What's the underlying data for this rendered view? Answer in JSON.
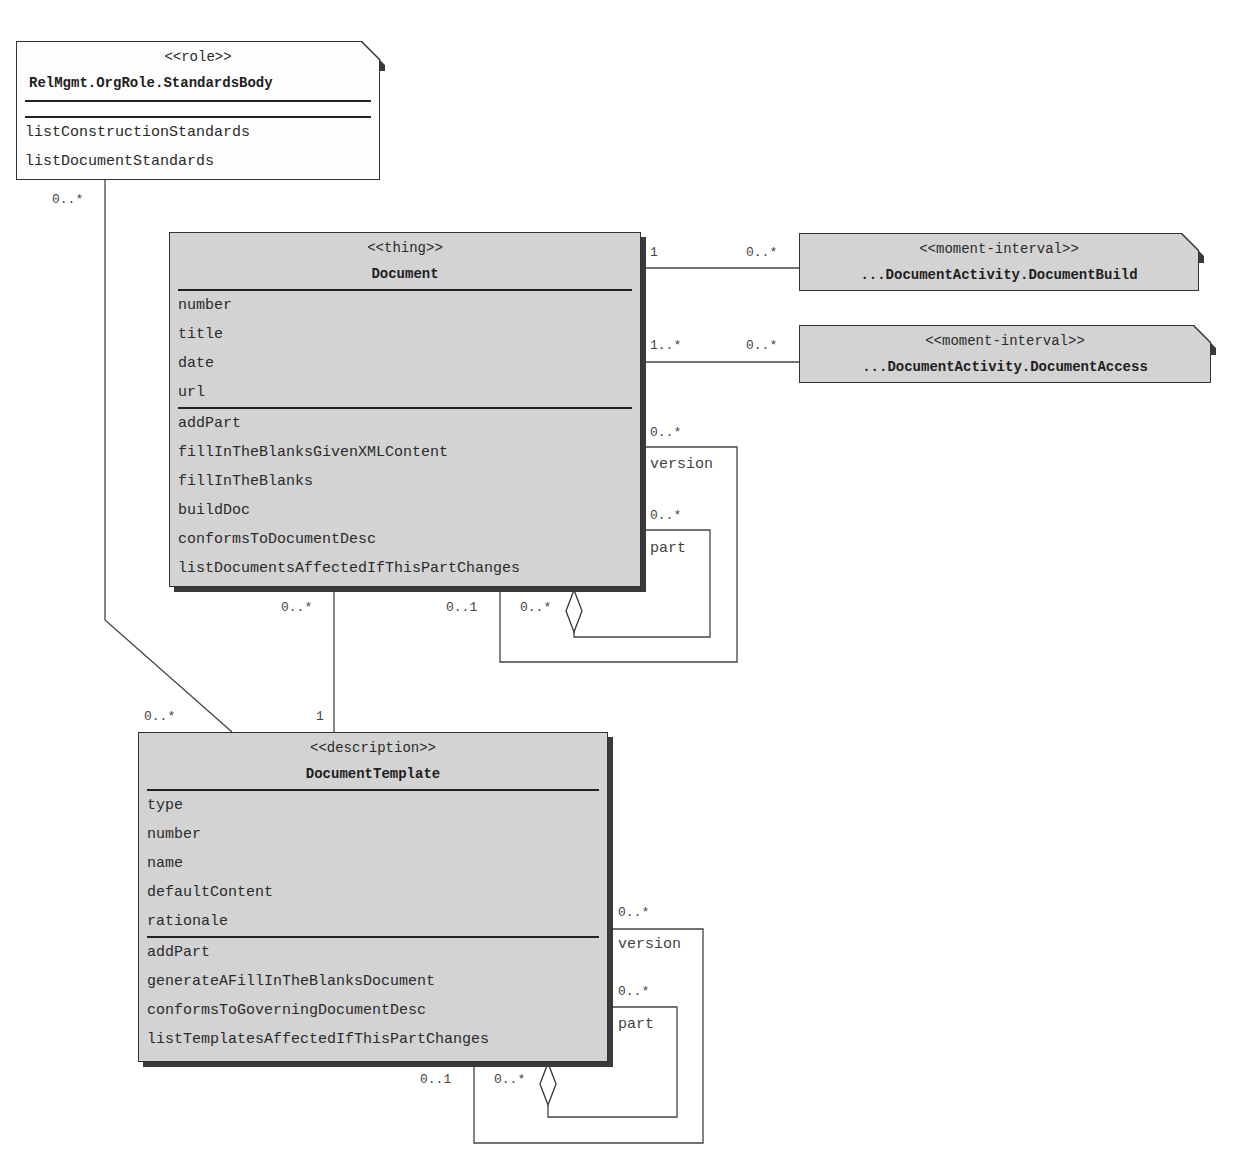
{
  "classes": {
    "standards_body": {
      "stereotype": "<<role>>",
      "name": "RelMgmt.OrgRole.StandardsBody",
      "attributes": [],
      "operations": [
        "listConstructionStandards",
        "listDocumentStandards"
      ]
    },
    "document": {
      "stereotype": "<<thing>>",
      "name": "Document",
      "attributes": [
        "number",
        "title",
        "date",
        "url"
      ],
      "operations": [
        "addPart",
        "fillInTheBlanksGivenXMLContent",
        "fillInTheBlanks",
        "buildDoc",
        "conformsToDocumentDesc",
        "listDocumentsAffectedIfThisPartChanges"
      ]
    },
    "document_build": {
      "stereotype": "<<moment-interval>>",
      "name": "...DocumentActivity.DocumentBuild"
    },
    "document_access": {
      "stereotype": "<<moment-interval>>",
      "name": "...DocumentActivity.DocumentAccess"
    },
    "document_template": {
      "stereotype": "<<description>>",
      "name": "DocumentTemplate",
      "attributes": [
        "type",
        "number",
        "name",
        "defaultContent",
        "rationale"
      ],
      "operations": [
        "addPart",
        "generateAFillInTheBlanksDocument",
        "conformsToGoverningDocumentDesc",
        "listTemplatesAffectedIfThisPartChanges"
      ]
    }
  },
  "associations": {
    "standards_to_template": {
      "from_mult": "0..*",
      "to_mult": "0..*"
    },
    "document_to_build": {
      "from_mult": "1",
      "to_mult": "0..*"
    },
    "document_to_access": {
      "from_mult": "1..*",
      "to_mult": "0..*"
    },
    "document_version": {
      "mult_top": "0..*",
      "role": "version",
      "mult_bottom": "0..1"
    },
    "document_part": {
      "mult_top": "0..*",
      "role": "part",
      "mult_bottom": "0..*"
    },
    "document_to_template": {
      "from_mult": "0..*",
      "to_mult": "1"
    },
    "template_version": {
      "mult_top": "0..*",
      "role": "version",
      "mult_bottom": "0..1"
    },
    "template_part": {
      "mult_top": "0..*",
      "role": "part",
      "mult_bottom": "0..*"
    }
  },
  "colors": {
    "class_fill": "#d3d3d3",
    "role_fill": "#fdfdfd",
    "line": "#333333"
  }
}
